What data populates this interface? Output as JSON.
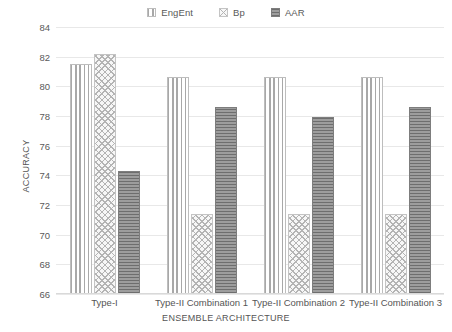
{
  "chart_data": {
    "type": "bar",
    "title": "",
    "xlabel": "ENSEMBLE ARCHITECTURE",
    "ylabel": "ACCURACY",
    "ylim": [
      66,
      84
    ],
    "ytick_step": 2,
    "yticks": [
      84,
      82,
      80,
      78,
      76,
      74,
      72,
      70,
      68,
      66
    ],
    "grid": true,
    "legend_position": "top-center",
    "categories": [
      "Type-I",
      "Type-II Combination 1",
      "Type-II Combination 2",
      "Type-II Combination 3"
    ],
    "series": [
      {
        "name": "EngEnt",
        "pattern": "vertical-lines",
        "color": "#a8a8a8",
        "values": [
          81.5,
          80.65,
          80.65,
          80.65
        ]
      },
      {
        "name": "Bp",
        "pattern": "crosshatch",
        "color": "#b4b4b4",
        "values": [
          82.2,
          71.4,
          71.4,
          71.4
        ]
      },
      {
        "name": "AAR",
        "pattern": "horizontal-lines",
        "color": "#8f8f8f",
        "values": [
          74.3,
          78.6,
          77.9,
          78.6
        ]
      }
    ]
  },
  "legend": {
    "items": [
      {
        "label": "EngEnt",
        "swatch": "vertical-lines-swatch"
      },
      {
        "label": "Bp",
        "swatch": "crosshatch-swatch"
      },
      {
        "label": "AAR",
        "swatch": "horizontal-lines-swatch"
      }
    ]
  },
  "axes": {
    "y_title": "ACCURACY",
    "x_title": "ENSEMBLE ARCHITECTURE",
    "y_tick_labels": [
      "84",
      "82",
      "80",
      "78",
      "76",
      "74",
      "72",
      "70",
      "68",
      "66"
    ],
    "x_tick_labels": [
      "Type-I",
      "Type-II Combination 1",
      "Type-II Combination 2",
      "Type-II Combination 3"
    ]
  },
  "colors": {
    "grid": "#e8e8e8",
    "text": "#555555",
    "engent": "#a8a8a8",
    "bp": "#b4b4b4",
    "aar": "#8f8f8f"
  }
}
